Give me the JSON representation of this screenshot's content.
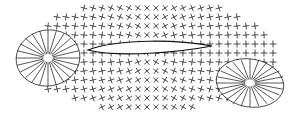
{
  "diagram": {
    "type": "overset mesh around airfoil with two elliptical grids",
    "stroke_color": "#111111",
    "background": "#ffffff",
    "left_ellipse": {
      "cx": 48,
      "cy": 58,
      "rx": 32,
      "ry": 28
    },
    "right_ellipse": {
      "cx": 250,
      "cy": 83,
      "rx": 34,
      "ry": 24
    },
    "airfoil": {
      "x1": 88,
      "x2": 212,
      "y": 50
    }
  }
}
